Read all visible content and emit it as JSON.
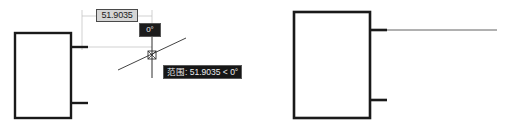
{
  "app": {
    "kind": "cad-drawing-canvas",
    "background_color": "#ffffff",
    "geometry_color": "#1a1a1a",
    "helper_line_color": "#b8b8b8"
  },
  "dynamic_input": {
    "distance_value": "51.9035",
    "distance_box_fill": "#d5d5d5",
    "distance_box_border": "#4a4a4a",
    "angle_value": "0°",
    "angle_box_fill": "#1c1c1c",
    "angle_box_text_color": "#f2f2f2"
  },
  "tracking_tooltip": {
    "text": "范围: 51.9035 < 0°",
    "fill": "#161616",
    "text_color": "#ededed",
    "border": "#5a5a5a"
  },
  "shapes": {
    "left_rectangle": {
      "label": "left-rectangle",
      "x": 15,
      "y": 33,
      "width": 56,
      "height": 85
    },
    "right_rectangle": {
      "label": "right-rectangle",
      "x": 294,
      "y": 12,
      "width": 76,
      "height": 106
    },
    "left_stub_upper": {
      "x1": 71,
      "y1": 47,
      "x2": 88,
      "y2": 47
    },
    "left_stub_lower": {
      "x1": 71,
      "y1": 103,
      "x2": 88,
      "y2": 103
    },
    "right_stub_upper": {
      "x1": 370,
      "y1": 30,
      "x2": 387,
      "y2": 30
    },
    "right_stub_lower": {
      "x1": 370,
      "y1": 100,
      "x2": 387,
      "y2": 100
    },
    "right_extension_line": {
      "x1": 387,
      "y1": 30,
      "x2": 497,
      "y2": 30
    }
  },
  "crosshair": {
    "center_x": 152,
    "center_y": 55,
    "vertical_top": 36,
    "vertical_bottom": 78,
    "polar_track_x1": 118,
    "polar_track_y1": 70,
    "polar_track_x2": 186,
    "polar_track_y2": 38
  },
  "dimension_guides": {
    "extension_left_x": 82,
    "extension_right_x": 152,
    "dim_line_y": 16,
    "extension_top_y": 10,
    "extension_bottom_y": 50,
    "rubber_band_y": 47,
    "rubber_band_x1": 88,
    "rubber_band_x2": 152
  }
}
